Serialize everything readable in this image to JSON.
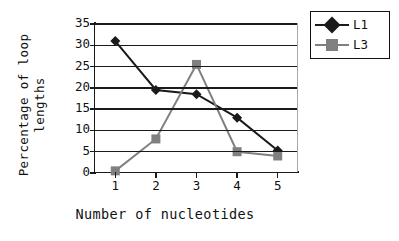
{
  "chart_data": {
    "type": "line",
    "title": "",
    "xlabel": "Number of nucleotides",
    "ylabel": "Percentage of loop lengths",
    "ylabel_line1": "Percentage of loop",
    "ylabel_line2": "lengths",
    "categories": [
      "1",
      "2",
      "3",
      "4",
      "5"
    ],
    "x": [
      1,
      2,
      3,
      4,
      5
    ],
    "series": [
      {
        "name": "L1",
        "values": [
          31,
          19.5,
          18.5,
          13,
          5.3
        ],
        "color": "#1a1a1a",
        "marker": "diamond"
      },
      {
        "name": "L3",
        "values": [
          0.5,
          8,
          25.5,
          5,
          4
        ],
        "color": "#808080",
        "marker": "square"
      }
    ],
    "ylim": [
      0,
      35
    ],
    "yticks": [
      "0",
      "5",
      "10",
      "15",
      "20",
      "25",
      "30",
      "35"
    ],
    "ytick_values": [
      0,
      5,
      10,
      15,
      20,
      25,
      30,
      35
    ],
    "grid": "horizontal",
    "legend_position": "top-right",
    "legend_entries": [
      "L1",
      "L3"
    ]
  },
  "legend": {
    "items": [
      {
        "label": "L1"
      },
      {
        "label": "L3"
      }
    ]
  },
  "colors": {
    "series_l1": "#1a1a1a",
    "series_l3": "#808080",
    "axis": "#1a1a1a",
    "grid": "#1a1a1a",
    "background": "#ffffff"
  }
}
